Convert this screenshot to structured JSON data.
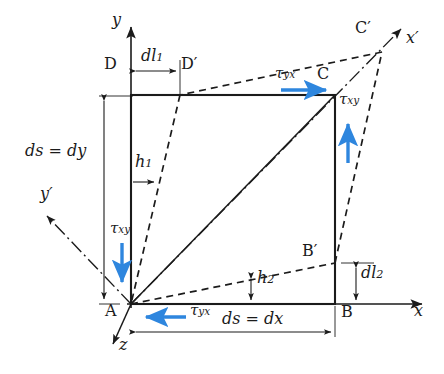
{
  "figure": {
    "type": "engineering-diagram",
    "background_color": "#ffffff",
    "line_color": "#1b1b1b",
    "stress_arrow_color": "#2e86de"
  },
  "axes": [
    {
      "name": "y-axis",
      "label": "y",
      "label_sub": "",
      "kind": "solid",
      "from": [
        131,
        304
      ],
      "to": [
        131,
        25
      ]
    },
    {
      "name": "x-axis",
      "label": "x",
      "label_sub": "",
      "kind": "solid",
      "from": [
        131,
        304
      ],
      "to": [
        425,
        304
      ]
    },
    {
      "name": "z-axis",
      "label": "z",
      "label_sub": "",
      "kind": "solid",
      "from": [
        131,
        304
      ],
      "to": [
        112,
        346
      ]
    },
    {
      "name": "x-prime-axis",
      "label": "x",
      "label_sub": "′",
      "kind": "dashdot",
      "from": [
        131,
        304
      ],
      "to": [
        404,
        26
      ]
    },
    {
      "name": "y-prime-axis",
      "label": "y",
      "label_sub": "′",
      "kind": "dashdot",
      "from": [
        131,
        304
      ],
      "to": [
        45,
        214
      ]
    }
  ],
  "points": {
    "A": {
      "label": "A",
      "prime": "",
      "x": 131,
      "y": 304
    },
    "B": {
      "label": "B",
      "prime": "",
      "x": 335,
      "y": 304
    },
    "C": {
      "label": "C",
      "prime": "",
      "x": 335,
      "y": 95
    },
    "D": {
      "label": "D",
      "prime": "",
      "x": 131,
      "y": 95
    },
    "Bp": {
      "label": "B",
      "prime": "′",
      "x": 335,
      "y": 263
    },
    "Cp": {
      "label": "C",
      "prime": "′",
      "x": 382,
      "y": 52
    },
    "Dp": {
      "label": "D",
      "prime": "′",
      "x": 180,
      "y": 95
    }
  },
  "element": {
    "name": "undeformed-rectangle",
    "corners": [
      "A",
      "B",
      "C",
      "D"
    ],
    "left": 131,
    "right": 335,
    "top": 95,
    "bottom": 304
  },
  "deformed": {
    "name": "deformed-quadrilateral",
    "corners": [
      "A",
      "Bp",
      "Cp",
      "Dp"
    ],
    "style": "dashed"
  },
  "stress_labels": [
    {
      "id": "tau-xy-left",
      "symbol": "τ",
      "sub": "xy",
      "x": 112,
      "y": 229,
      "arrow": "down",
      "arrow_x": 122,
      "arrow_y1": 243,
      "arrow_y2": 285
    },
    {
      "id": "tau-xy-right",
      "symbol": "τ",
      "sub": "xy",
      "x": 341,
      "y": 100,
      "arrow": "up",
      "arrow_x": 348,
      "arrow_y1": 163,
      "arrow_y2": 120
    },
    {
      "id": "tau-yx-top",
      "symbol": "τ",
      "sub": "yx",
      "x": 276,
      "y": 74,
      "arrow": "right",
      "arrow_y": 90,
      "arrow_x1": 281,
      "arrow_x2": 329
    },
    {
      "id": "tau-yx-bottom",
      "symbol": "τ",
      "sub": "yx",
      "x": 188,
      "y": 310,
      "arrow": "left",
      "arrow_y": 317,
      "arrow_x1": 186,
      "arrow_x2": 143
    }
  ],
  "dimensions": [
    {
      "id": "ds-dy",
      "text": "ds = dy",
      "x": 26,
      "y": 145,
      "line_x": 104,
      "line_y1": 97,
      "line_y2": 303,
      "orientation": "vertical"
    },
    {
      "id": "ds-dx",
      "text": "ds = dx",
      "x": 223,
      "y": 313,
      "line_y": 332,
      "line_x1": 132,
      "line_x2": 334,
      "orientation": "horizontal"
    },
    {
      "id": "dl1",
      "symbol": "dl",
      "sub": "1",
      "x": 142,
      "y": 56,
      "line_y": 71,
      "line_x1": 132,
      "line_x2": 179,
      "orientation": "horizontal"
    },
    {
      "id": "dl2",
      "symbol": "dl",
      "sub": "2",
      "x": 362,
      "y": 272,
      "line_x": 356,
      "line_y1": 264,
      "line_y2": 303,
      "orientation": "vertical"
    },
    {
      "id": "h1",
      "symbol": "h",
      "sub": "1",
      "x": 136,
      "y": 160,
      "line_y": 182,
      "line_x1": 132,
      "line_x2": 156,
      "orientation": "horizontal"
    },
    {
      "id": "h2",
      "symbol": "h",
      "sub": "2",
      "x": 258,
      "y": 276,
      "line_x": 251,
      "line_y1": 277,
      "line_y2": 302,
      "orientation": "vertical"
    }
  ],
  "point_label_positions": {
    "A": {
      "x": 106,
      "y": 310
    },
    "B": {
      "x": 342,
      "y": 311
    },
    "C": {
      "x": 318,
      "y": 74
    },
    "D": {
      "x": 105,
      "y": 63
    },
    "Bp": {
      "x": 304,
      "y": 250
    },
    "Cp": {
      "x": 356,
      "y": 27
    },
    "Dp": {
      "x": 182,
      "y": 63
    }
  },
  "axis_label_positions": {
    "y": {
      "x": 112,
      "y": 18
    },
    "x": {
      "x": 414,
      "y": 310
    },
    "z": {
      "x": 119,
      "y": 344
    },
    "xp": {
      "x": 408,
      "y": 38
    },
    "yp": {
      "x": 42,
      "y": 192
    }
  }
}
